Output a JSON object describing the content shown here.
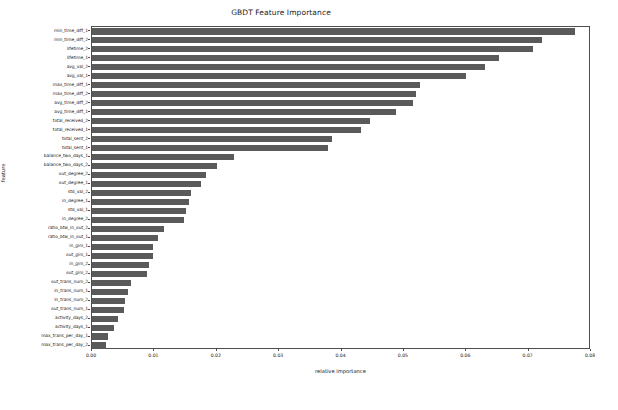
{
  "chart_data": {
    "type": "bar",
    "orientation": "horizontal",
    "title": "GBDT Feature Importance",
    "xlabel": "relative importance",
    "ylabel": "feature",
    "xlim": [
      0.0,
      0.08
    ],
    "ylim": [
      0,
      35
    ],
    "grid": false,
    "legend": null,
    "bar_color": "#5a5a5a",
    "xticks": [
      "0.00",
      "0.01",
      "0.02",
      "0.03",
      "0.04",
      "0.05",
      "0.06",
      "0.07",
      "0.08"
    ],
    "xtick_values": [
      0.0,
      0.01,
      0.02,
      0.03,
      0.04,
      0.05,
      0.06,
      0.07,
      0.08
    ],
    "categories": [
      "min_time_diff_1",
      "min_time_diff_2",
      "lifetime_2",
      "lifetime_1",
      "avg_val_2",
      "avg_val_1",
      "max_time_diff_1",
      "max_time_diff_2",
      "avg_time_diff_2",
      "avg_time_diff_1",
      "total_received_2",
      "total_received_1",
      "total_sent_2",
      "total_sent_1",
      "balance_two_days_1",
      "balance_two_days_2",
      "out_degree_2",
      "out_degree_1",
      "std_val_2",
      "in_degree_1",
      "std_val_1",
      "in_degree_2",
      "ratio_btw_in_out_2",
      "ratio_btw_in_out_1",
      "in_gini_1",
      "out_gini_1",
      "in_gini_2",
      "out_gini_2",
      "out_trans_num_2",
      "in_trans_num_1",
      "in_trans_num_2",
      "out_trans_num_1",
      "activity_days_2",
      "activity_days_1",
      "max_trans_per_day_1",
      "max_trans_per_day_2"
    ],
    "values": [
      0.0775,
      0.0722,
      0.0707,
      0.0652,
      0.063,
      0.06,
      0.0526,
      0.052,
      0.0515,
      0.0488,
      0.0445,
      0.0432,
      0.0385,
      0.0378,
      0.0228,
      0.02,
      0.0182,
      0.0175,
      0.0158,
      0.0156,
      0.015,
      0.0147,
      0.0115,
      0.0106,
      0.0098,
      0.0097,
      0.0092,
      0.0088,
      0.0062,
      0.0058,
      0.0053,
      0.0052,
      0.0042,
      0.0035,
      0.0025,
      0.0022
    ]
  }
}
